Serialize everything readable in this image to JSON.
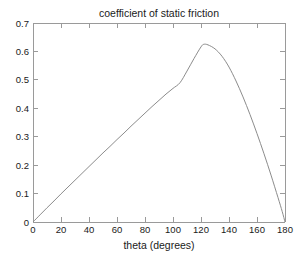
{
  "chart_data": {
    "type": "line",
    "title": "coefficient of static friction",
    "xlabel": "theta (degrees)",
    "ylabel": "",
    "xlim": [
      0,
      180
    ],
    "ylim": [
      0,
      0.7
    ],
    "grid": false,
    "legend": null,
    "xticks": [
      0,
      20,
      40,
      60,
      80,
      100,
      120,
      140,
      160,
      180
    ],
    "xtick_labels": [
      "0",
      "20",
      "40",
      "60",
      "80",
      "100",
      "120",
      "140",
      "160",
      "180"
    ],
    "yticks": [
      0,
      0.1,
      0.2,
      0.3,
      0.4,
      0.5,
      0.6,
      0.7
    ],
    "ytick_labels": [
      "0",
      "0.1",
      "0.2",
      "0.3",
      "0.4",
      "0.5",
      "0.6",
      "0.7"
    ],
    "series": [
      {
        "name": "mu_s",
        "color": "#8c8c8c",
        "x": [
          0,
          5,
          10,
          15,
          20,
          25,
          30,
          35,
          40,
          45,
          50,
          55,
          60,
          65,
          70,
          75,
          80,
          85,
          90,
          95,
          100,
          105,
          110,
          115,
          120,
          122,
          125,
          130,
          135,
          140,
          145,
          150,
          155,
          160,
          165,
          170,
          175,
          178,
          180
        ],
        "y": [
          0.0,
          0.025,
          0.05,
          0.074,
          0.099,
          0.123,
          0.147,
          0.171,
          0.195,
          0.219,
          0.243,
          0.266,
          0.29,
          0.313,
          0.337,
          0.36,
          0.383,
          0.406,
          0.428,
          0.45,
          0.47,
          0.49,
          0.531,
          0.575,
          0.616,
          0.625,
          0.623,
          0.609,
          0.583,
          0.545,
          0.496,
          0.44,
          0.378,
          0.311,
          0.24,
          0.165,
          0.086,
          0.037,
          0.0
        ]
      }
    ],
    "peak": {
      "x": 122,
      "y": 0.625
    },
    "endpoints": [
      {
        "x": 0,
        "y": 0
      },
      {
        "x": 180,
        "y": 0
      }
    ]
  },
  "axes": {
    "title_text": "coefficient of static friction",
    "xaxis_title": "theta (degrees)"
  }
}
